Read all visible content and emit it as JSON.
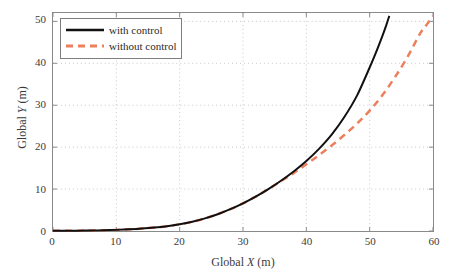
{
  "chart_data": {
    "type": "line",
    "title": "",
    "xlabel": "Global X (m)",
    "xlabel_prefix": "Global ",
    "xlabel_var": "X",
    "xlabel_suffix": " (m)",
    "ylabel": "Global Y (m)",
    "ylabel_prefix": "Global ",
    "ylabel_var": "Y",
    "ylabel_suffix": " (m)",
    "xlim": [
      0,
      60
    ],
    "ylim": [
      0,
      52
    ],
    "xticks": [
      0,
      10,
      20,
      30,
      40,
      50,
      60
    ],
    "yticks": [
      0,
      10,
      20,
      30,
      40,
      50
    ],
    "xtick_labels": [
      "0",
      "10",
      "20",
      "30",
      "40",
      "50",
      "60"
    ],
    "ytick_labels": [
      "0",
      "10",
      "20",
      "30",
      "40",
      "50"
    ],
    "grid": true,
    "grid_style": "dotted",
    "grid_color": "#c8c8c8",
    "legend_position": "top-left",
    "series": [
      {
        "name": "with control",
        "style": "solid",
        "color": "#111111",
        "width": 2.0,
        "x": [
          0,
          2,
          4,
          6,
          8,
          10,
          12,
          14,
          16,
          18,
          20,
          22,
          24,
          26,
          28,
          30,
          32,
          34,
          36,
          38,
          40,
          42,
          44,
          46,
          48,
          50,
          51,
          52,
          52.6,
          53.1
        ],
        "y": [
          0.05,
          0.06,
          0.08,
          0.12,
          0.18,
          0.27,
          0.4,
          0.58,
          0.82,
          1.15,
          1.6,
          2.2,
          3.0,
          4.0,
          5.2,
          6.6,
          8.2,
          10.0,
          12.0,
          14.2,
          16.7,
          19.6,
          23.0,
          27.2,
          32.3,
          39.0,
          42.6,
          46.5,
          49.0,
          51.3
        ]
      },
      {
        "name": "without control",
        "style": "dashed",
        "color": "#ec7f5c",
        "width": 2.5,
        "dash": "7,5",
        "x": [
          0,
          2,
          4,
          6,
          8,
          10,
          12,
          14,
          16,
          18,
          20,
          22,
          24,
          26,
          28,
          30,
          32,
          34,
          36,
          38,
          40,
          42,
          44,
          46,
          48,
          50,
          52,
          54,
          56,
          58,
          59,
          60
        ],
        "y": [
          0.05,
          0.06,
          0.08,
          0.12,
          0.18,
          0.27,
          0.4,
          0.58,
          0.82,
          1.15,
          1.6,
          2.2,
          3.0,
          4.0,
          5.2,
          6.6,
          8.2,
          10.0,
          11.9,
          13.8,
          15.9,
          18.1,
          20.4,
          22.9,
          25.6,
          28.7,
          32.4,
          36.7,
          41.6,
          47.2,
          49.2,
          51.3
        ]
      }
    ]
  },
  "legend": {
    "items": [
      {
        "label": "with control",
        "color": "#111111",
        "style": "solid"
      },
      {
        "label": "without control",
        "color": "#ec7f5c",
        "style": "dashed"
      }
    ]
  },
  "colors": {
    "series_solid": "#111111",
    "series_dashed": "#ec7f5c",
    "grid": "#c8c8c8",
    "frame": "#8a8a8a",
    "text": "#3b3b3b",
    "background": "#ffffff"
  }
}
